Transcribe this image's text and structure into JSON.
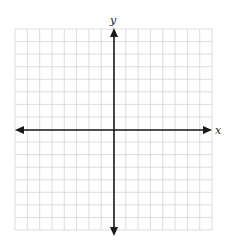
{
  "diagram": {
    "type": "coordinate-plane",
    "x_axis_label": "x",
    "y_axis_label": "y",
    "grid": {
      "columns": 16,
      "rows": 16,
      "cells_left_of_origin": 8,
      "cells_right_of_origin": 8,
      "cells_above_origin": 8,
      "cells_below_origin": 8,
      "line_color": "#d4d4d4",
      "border_color": "#d4d4d4"
    },
    "axis_color": "#1a1a1a",
    "background": "#ffffff"
  }
}
